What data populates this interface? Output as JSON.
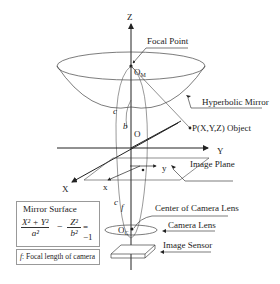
{
  "diagram": {
    "type": "hyperbolic omnidirectional camera geometry",
    "axes": {
      "z": "Z",
      "y": "Y",
      "x": "X",
      "origin": "O"
    },
    "points": {
      "mirror_focus": "O",
      "mirror_focus_sub": "M",
      "camera_center": "O",
      "camera_center_sub": "C",
      "object": "P(X,Y,Z) Object"
    },
    "image_plane_axes": {
      "x": "x",
      "y": "y"
    },
    "distances": {
      "b": "b",
      "c_upper": "c",
      "c_lower": "c",
      "f": "f"
    },
    "callouts": {
      "focal_point": "Focal Point",
      "hyperbolic_mirror": "Hyperbolic Mirror",
      "image_plane": "Image Plane",
      "center_of_camera_lens": "Center of Camera Lens",
      "camera_lens": "Camera Lens",
      "image_sensor": "Image Sensor"
    },
    "equation_box": {
      "title": "Mirror Surface",
      "num1": "X² + Y²",
      "den1": "a²",
      "minus": "−",
      "num2": "Z²",
      "den2": "b²",
      "rhs": "= −1"
    },
    "legend_box": {
      "f_symbol": "f",
      "text": ": Focal length of camera"
    },
    "colors": {
      "line": "#222222",
      "box_border": "#999999",
      "background": "#ffffff"
    }
  }
}
